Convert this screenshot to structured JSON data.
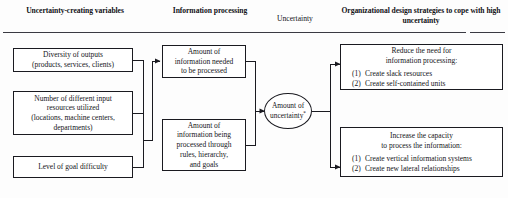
{
  "headers": [
    {
      "id": "uncertainty-creating-variables",
      "lines": [
        "Uncertainty-creating",
        "variables"
      ],
      "bold": true
    },
    {
      "id": "information-processing",
      "lines": [
        "Information",
        "processing"
      ],
      "bold": true
    },
    {
      "id": "uncertainty",
      "lines": [
        "Uncertainty"
      ],
      "bold": false
    },
    {
      "id": "organizational-design-strategies",
      "lines": [
        "Organizational design strategies to",
        "cope with high uncertainty"
      ],
      "bold": true
    }
  ],
  "variables": [
    {
      "id": "diversity-of-outputs",
      "lines": [
        "Diversity of outputs",
        "(products, services, clients)"
      ]
    },
    {
      "id": "input-resources",
      "lines": [
        "Number of different input",
        "resources utilized",
        "(locations, machine centers,",
        "departments)"
      ]
    },
    {
      "id": "goal-difficulty",
      "lines": [
        "Level of goal difficulty"
      ]
    }
  ],
  "processing": [
    {
      "id": "information-needed",
      "lines": [
        "Amount of",
        "information needed",
        "to be processed"
      ]
    },
    {
      "id": "information-being-processed",
      "lines": [
        "Amount of",
        "information being",
        "processed through",
        "rules, hierarchy,",
        "and goals"
      ]
    }
  ],
  "uncertainty_node": {
    "id": "amount-of-uncertainty",
    "lines": [
      "Amount of",
      "uncertainty"
    ],
    "footnote_marker": "*"
  },
  "strategies": [
    {
      "id": "reduce-need",
      "title": [
        "Reduce the need for",
        "information processing:"
      ],
      "items": [
        {
          "num": "(1)",
          "text": "Create slack resources"
        },
        {
          "num": "(2)",
          "text": "Create self-contained units"
        }
      ]
    },
    {
      "id": "increase-capacity",
      "title": [
        "Increase the capacity",
        "to process the information:"
      ],
      "items": [
        {
          "num": "(1)",
          "text": "Create vertical information systems"
        },
        {
          "num": "(2)",
          "text": "Create new lateral relationships"
        }
      ]
    }
  ],
  "colors": {
    "ink": "#1a1a20",
    "rule": "#3a3a42",
    "background": "#fdfdfd"
  }
}
